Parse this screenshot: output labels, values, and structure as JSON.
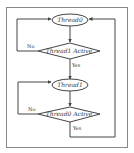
{
  "diagram": {
    "nodes": [
      {
        "id": "thread0",
        "shape": "ellipse",
        "label": "Thread0"
      },
      {
        "id": "thread1-active",
        "shape": "diamond",
        "label": "Thread1 Active"
      },
      {
        "id": "thread1",
        "shape": "ellipse",
        "label": "Thread1"
      },
      {
        "id": "thread0-active",
        "shape": "diamond",
        "label": "Thread0 Active"
      }
    ],
    "edges": [
      {
        "from": "thread0",
        "to": "thread1-active",
        "label": ""
      },
      {
        "from": "thread1-active",
        "to": "thread0",
        "label": "No"
      },
      {
        "from": "thread1-active",
        "to": "thread1",
        "label": "Yes"
      },
      {
        "from": "thread1",
        "to": "thread0-active",
        "label": ""
      },
      {
        "from": "thread0-active",
        "to": "thread1",
        "label": "No"
      },
      {
        "from": "thread0-active",
        "to": "thread0",
        "label": "Yes"
      }
    ],
    "labels": {
      "n1": "Thread0",
      "d1": "Thread1 Active",
      "n2": "Thread1",
      "d2": "Thread0 Active",
      "no": "No",
      "yes": "Yes"
    },
    "colors": {
      "line": "#555555",
      "frame": "#888888"
    }
  }
}
